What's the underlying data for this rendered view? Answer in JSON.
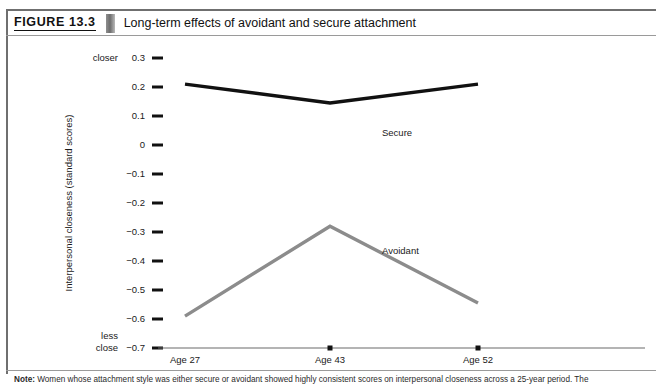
{
  "figure": {
    "number": "FIGURE 13.3",
    "title": "Long-term effects of avoidant and secure attachment",
    "note_label": "Note:",
    "note_text": " Women whose attachment style was either secure or avoidant showed highly consistent scores on interpersonal closeness across a 25-year period. The"
  },
  "chart_data": {
    "type": "line",
    "title": "Long-term effects of avoidant and secure attachment",
    "xlabel": "",
    "ylabel": "Interpersonal closeness (standard scores)",
    "categories": [
      "Age 27",
      "Age 43",
      "Age 52"
    ],
    "series": [
      {
        "name": "Secure",
        "color": "#111111",
        "values": [
          0.21,
          0.145,
          0.21
        ]
      },
      {
        "name": "Avoidant",
        "color": "#8c8c8c",
        "values": [
          -0.59,
          -0.28,
          -0.545
        ]
      }
    ],
    "ylim": [
      -0.7,
      0.3
    ],
    "yticks": [
      "0.3",
      "0.2",
      "0.1",
      "0",
      "−0.1",
      "−0.2",
      "−0.3",
      "−0.4",
      "−0.5",
      "−0.6",
      "−0.7"
    ],
    "ytick_values": [
      0.3,
      0.2,
      0.1,
      0,
      -0.1,
      -0.2,
      -0.3,
      -0.4,
      -0.5,
      -0.6,
      -0.7
    ],
    "axis_anchor_top": "closer",
    "axis_anchor_bottom_line1": "less",
    "axis_anchor_bottom_line2": "close",
    "grid": false,
    "legend": "inline-annotations",
    "annotations": [
      {
        "text": "Secure",
        "x_cat": "Age 43",
        "y": 0.03
      },
      {
        "text": "Avoidant",
        "x_cat": "Age 43",
        "y": -0.375
      }
    ]
  }
}
